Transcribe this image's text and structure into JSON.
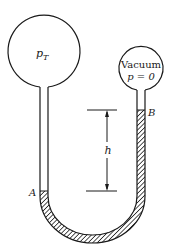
{
  "diagram": {
    "left_bulb": {
      "label_main": "p",
      "label_sub": "T"
    },
    "right_bulb": {
      "line1": "Vacuum",
      "line2": "p = 0"
    },
    "points": {
      "a": "A",
      "b": "B"
    },
    "dimension": {
      "label": "h"
    },
    "colors": {
      "stroke": "#1a1a1a",
      "background": "#ffffff",
      "fluid_hatch": "#1a1a1a"
    }
  }
}
